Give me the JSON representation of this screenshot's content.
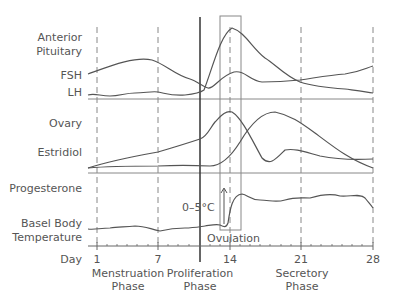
{
  "diagram": {
    "panels": [
      {
        "id": "anterior-pituitary",
        "label_line1": "Anterior",
        "label_line2": "Pituitary",
        "series": [
          "FSH",
          "LH"
        ]
      },
      {
        "id": "ovary",
        "label": "Ovary",
        "series": [
          "Estridiol",
          "Progesterone"
        ]
      },
      {
        "id": "basal-body-temperature",
        "label_line1": "Basel Body",
        "label_line2": "Temperature"
      }
    ],
    "labels": {
      "fsh": "FSH",
      "lh": "LH",
      "estridiol": "Estridiol",
      "progesterone": "Progesterone",
      "temp_rise": "0–5°C",
      "ovulation": "Ovulation",
      "day": "Day"
    },
    "x_axis": {
      "label": "Day",
      "ticks": [
        "1",
        "7",
        "14",
        "21",
        "28"
      ]
    },
    "phases": [
      {
        "line1": "Menstruation",
        "line2": "Phase"
      },
      {
        "line1": "Proliferation",
        "line2": "Phase"
      },
      {
        "line1": "Secretory",
        "line2": "Phase"
      }
    ],
    "colors": {
      "line": "#555555",
      "grid": "#888888",
      "background": "#ffffff"
    }
  }
}
